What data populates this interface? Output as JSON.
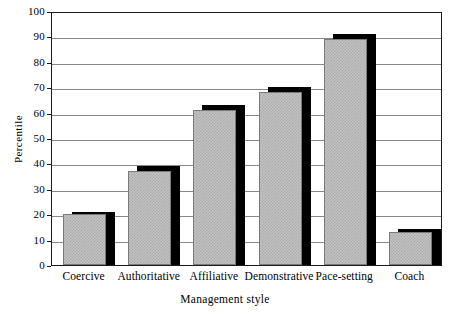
{
  "chart_data": {
    "type": "bar",
    "title": "",
    "xlabel": "Management style",
    "ylabel": "Percentile",
    "categories": [
      "Coercive",
      "Authoritative",
      "Affiliative",
      "Demonstrative",
      "Pace-setting",
      "Coach"
    ],
    "values": [
      20,
      37,
      61,
      68,
      89,
      13
    ],
    "bar_top_values": [
      21,
      39,
      63,
      70,
      91,
      14
    ],
    "ylim": [
      0,
      100
    ],
    "yticks": [
      0,
      10,
      20,
      30,
      40,
      50,
      60,
      70,
      80,
      90,
      100
    ],
    "ytick_labels": [
      "0",
      "10",
      "20",
      "30",
      "40",
      "50",
      "60",
      "70",
      "80",
      "90",
      "100"
    ],
    "grid": true,
    "legend": "none",
    "series": [
      {
        "name": "Percentile",
        "values": [
          20,
          37,
          61,
          68,
          89,
          13
        ]
      }
    ],
    "style": {
      "bar_fill": "#c2c2c2",
      "bar_pattern": "checkerboard-dither",
      "bar_edge": "#7a7a7a",
      "bar_shadow": "#000000",
      "gridline_color": "#888888",
      "frame_color": "#1a1a1a",
      "background": "#ffffff"
    }
  }
}
